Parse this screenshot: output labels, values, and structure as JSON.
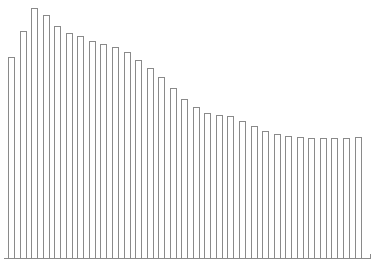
{
  "chart_data": {
    "type": "bar",
    "title": "",
    "xlabel": "",
    "ylabel": "",
    "grid": false,
    "legend": null,
    "categories": [
      "1",
      "2",
      "3",
      "4",
      "5",
      "6",
      "7",
      "8",
      "9",
      "10",
      "11",
      "12",
      "13",
      "14",
      "15",
      "16",
      "17",
      "18",
      "19",
      "20",
      "21",
      "22",
      "23",
      "24",
      "25",
      "26",
      "27",
      "28",
      "29",
      "30",
      "31"
    ],
    "values": [
      201,
      227,
      250,
      243,
      232,
      225,
      222,
      217,
      214,
      211,
      206,
      198,
      190,
      181,
      170,
      159,
      151,
      145,
      143,
      142,
      137,
      132,
      127,
      124,
      122,
      121,
      120,
      120,
      120,
      120,
      121
    ],
    "ylim": [
      0,
      250
    ],
    "style": {
      "bar_fill": "#ffffff",
      "bar_stroke": "#8a8a8a",
      "axis_color": "#8a8a8a"
    }
  },
  "layout": {
    "plot_left": 8,
    "baseline_y": 258,
    "bar_pitch": 11.55,
    "bar_width": 7,
    "axis_right": 370
  }
}
